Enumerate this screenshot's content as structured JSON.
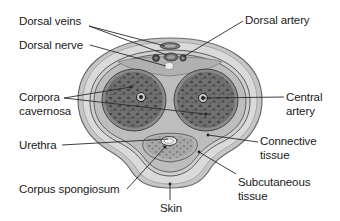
{
  "diagram": {
    "colors": {
      "outer_skin": "#c9c9c9",
      "skin_outline": "#6a6a6a",
      "subcutaneous": "#dcdcdc",
      "connective": "#bdbdbd",
      "cavernosa_fill": "#6f6f6f",
      "cavernosa_spots": "#4a4a4a",
      "spongiosum_fill": "#a9a9a9",
      "leader_line": "#2a2a2a",
      "text": "#1a1a1a"
    },
    "labels": {
      "dorsal_veins": "Dorsal veins",
      "dorsal_nerve": "Dorsal nerve",
      "dorsal_artery": "Dorsal artery",
      "corpora_cavernosa_1": "Corpora",
      "corpora_cavernosa_2": "cavernosa",
      "central_artery_1": "Central",
      "central_artery_2": "artery",
      "urethra": "Urethra",
      "connective_tissue_1": "Connective",
      "connective_tissue_2": "tissue",
      "corpus_spongiosum": "Corpus spongiosum",
      "subcutaneous_tissue_1": "Subcutaneous",
      "subcutaneous_tissue_2": "tissue",
      "skin": "Skin"
    }
  }
}
